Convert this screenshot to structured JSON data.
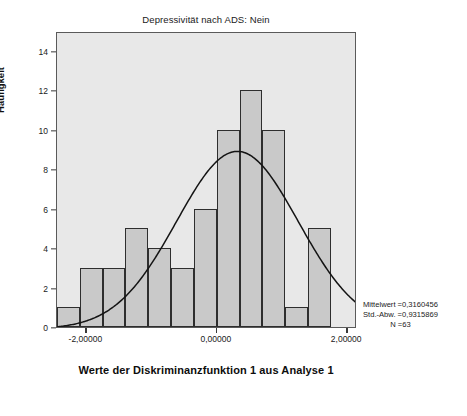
{
  "chart_data": {
    "type": "bar",
    "title": "Depressivität nach ADS: Nein",
    "xlabel": "Werte der Diskriminanzfunktion 1 aus Analyse 1",
    "ylabel": "Häufigkeit",
    "grid": false,
    "legend": "none",
    "xlim": [
      -2.45,
      2.15
    ],
    "ylim": [
      0,
      15
    ],
    "bin_width": 0.35,
    "bin_starts": [
      -2.45,
      -2.1,
      -1.75,
      -1.4,
      -1.05,
      -0.7,
      -0.35,
      0.0,
      0.35,
      0.7,
      1.05,
      1.4
    ],
    "categories": [
      "-2,45",
      "-2,10",
      "-1,75",
      "-1,40",
      "-1,05",
      "-0,70",
      "-0,35",
      "0,00",
      "0,35",
      "0,70",
      "1,05",
      "1,40"
    ],
    "values": [
      1,
      3,
      3,
      5,
      4,
      3,
      6,
      10,
      12,
      10,
      1,
      5
    ],
    "xticks": [
      -2,
      0,
      2
    ],
    "xtick_labels": [
      "-2,00000",
      "0,00000",
      "2,00000"
    ],
    "yticks": [
      0,
      2,
      4,
      6,
      8,
      10,
      12,
      14
    ],
    "ytick_labels": [
      "0",
      "2",
      "4",
      "6",
      "8",
      "10",
      "12",
      "14"
    ],
    "overlay": {
      "type": "normal-curve",
      "mean": 0.3160456,
      "sd": 0.9315869,
      "n": 63,
      "peak_value": 9.0
    },
    "colors": {
      "bar_fill": "#c9c9c9",
      "bar_edge": "#2e2e2e",
      "plot_background": "#e8e8e8",
      "frame": "#5a5a5a",
      "curve": "#141414",
      "text": "#1a1a1a"
    }
  },
  "annotations": {
    "mean_line": "Mittelwert =0,3160456",
    "sd_line": "Std.-Abw. =0,9315869",
    "n_line": "N =63"
  }
}
